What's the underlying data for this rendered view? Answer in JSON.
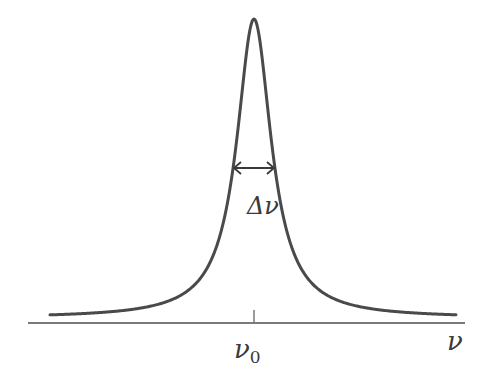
{
  "figure": {
    "labels": {
      "linewidth": "Δν",
      "center": "ν",
      "center_sub": "0",
      "axis": "ν"
    },
    "colors": {
      "curve": "#4a4a4a",
      "axis": "#7a7a7a",
      "text": "#3a3a3a",
      "background": "#ffffff"
    }
  },
  "chart_data": {
    "type": "line",
    "title": "",
    "xlabel": "ν",
    "ylabel": "",
    "shape": "lorentzian",
    "center_label": "ν0",
    "fwhm_label": "Δν",
    "pixel_geometry": {
      "center_x": 254,
      "baseline_y": 318,
      "peak_y": 19,
      "fwhm_px": 42,
      "x_start": 50,
      "x_end": 456,
      "axis_y": 323,
      "axis_x_start": 28,
      "axis_x_end": 465,
      "half_max_y": 168
    },
    "grid": false,
    "legend": null
  }
}
